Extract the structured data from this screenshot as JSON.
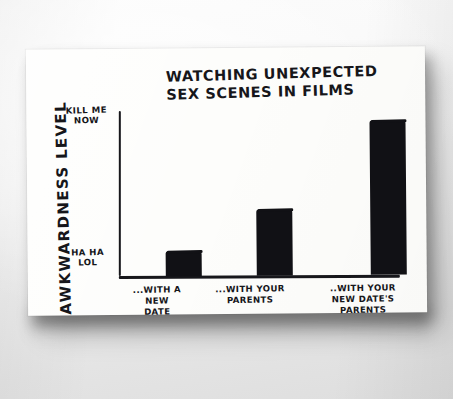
{
  "chart_data": {
    "type": "bar",
    "title": "WATCHING UNEXPECTED SEX SCENES IN FILMS",
    "title_line1": "WATCHING UNEXPECTED",
    "title_line2": "SEX SCENES IN FILMS",
    "xlabel": "",
    "ylabel": "AWKWARDNESS LEVEL",
    "categories": [
      "...WITH A NEW DATE",
      "...WITH YOUR PARENTS",
      "...WITH YOUR NEW DATE'S PARENTS"
    ],
    "values": [
      15,
      40,
      94
    ],
    "ylim": [
      0,
      100
    ],
    "ytick_labels": [
      "HA HA LOL",
      "KILL ME NOW"
    ],
    "ytick_values": [
      0,
      100
    ],
    "grid": false,
    "legend": false,
    "bar_color": "#111115",
    "ink_color": "#16161a",
    "paper_color": "#fdfdfb"
  },
  "axis": {
    "y_label_text": "AWKWARDNESS LEVEL",
    "y_tick_top": "KILL ME NOW",
    "y_tick_top_line1": "KILL ME",
    "y_tick_top_line2": "NOW",
    "y_tick_bottom": "HA HA LOL",
    "y_tick_bottom_line1": "HA HA",
    "y_tick_bottom_line2": "LOL"
  },
  "bars": [
    {
      "label": "...WITH A NEW DATE",
      "label_line1": "...WITH A",
      "label_line2": "NEW",
      "label_line3": "DATE",
      "value": 15
    },
    {
      "label": "...WITH YOUR PARENTS",
      "label_line1": "...WITH YOUR",
      "label_line2": "PARENTS",
      "label_line3": "",
      "value": 40
    },
    {
      "label": "...WITH YOUR NEW DATE'S PARENTS",
      "label_line1": "..WITH YOUR",
      "label_line2": "NEW DATE'S",
      "label_line3": "PARENTS",
      "value": 94
    }
  ]
}
